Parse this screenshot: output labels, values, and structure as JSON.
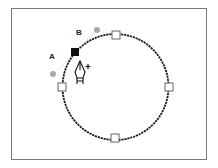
{
  "diagram": {
    "labels": {
      "a": "A",
      "b": "B"
    },
    "circle": {
      "cx": 115.5,
      "cy": 87,
      "r": 53
    },
    "anchors": [
      {
        "name": "top",
        "x": 116,
        "y": 35,
        "state": "unselected"
      },
      {
        "name": "left",
        "x": 62,
        "y": 87,
        "state": "unselected"
      },
      {
        "name": "right",
        "x": 169,
        "y": 87,
        "state": "unselected"
      },
      {
        "name": "bottom",
        "x": 115,
        "y": 138,
        "state": "unselected"
      },
      {
        "name": "new",
        "x": 75,
        "y": 52,
        "state": "selected"
      }
    ],
    "direction_handles": [
      {
        "name": "handle-a",
        "x": 53,
        "y": 74
      },
      {
        "name": "handle-b",
        "x": 97,
        "y": 30
      }
    ],
    "cursor": {
      "icon": "pen-add-anchor-icon",
      "modifier": "+"
    },
    "colors": {
      "frame": "#7a7a7a",
      "path": "#1a1a1a",
      "selected_anchor": "#111111",
      "handle_point": "#a8a8a8"
    }
  }
}
